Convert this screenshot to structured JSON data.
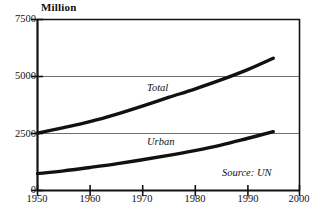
{
  "chart_data": {
    "type": "line",
    "title": "",
    "subtitle": "",
    "unit_label": "Million",
    "xlabel": "",
    "ylabel": "",
    "xlim": [
      1950,
      2000
    ],
    "ylim": [
      0,
      7500
    ],
    "xticks": [
      "1950",
      "1960",
      "1970",
      "1980",
      "1990",
      "2000"
    ],
    "xtick_values": [
      1950,
      1960,
      1970,
      1980,
      1990,
      2000
    ],
    "yticks": [
      "0",
      "2500",
      "5000",
      "7500"
    ],
    "ytick_values": [
      0,
      2500,
      5000,
      7500
    ],
    "grid": "horizontal",
    "gridlines_at": [
      2500,
      5000
    ],
    "legend_position": "inline-annotations",
    "annotations": [
      {
        "name": "total-label",
        "text": "Total",
        "x": 1972,
        "y": 4150
      },
      {
        "name": "urban-label",
        "text": "Urban",
        "x": 1972,
        "y": 1800
      },
      {
        "name": "source-note",
        "text": "Source: UN",
        "x": 1990,
        "y": 500
      }
    ],
    "x": [
      1950,
      1955,
      1960,
      1965,
      1970,
      1975,
      1980,
      1985,
      1990,
      1995
    ],
    "series": [
      {
        "name": "Total",
        "values": [
          2520,
          2760,
          3020,
          3340,
          3700,
          4080,
          4450,
          4850,
          5290,
          5800
        ]
      },
      {
        "name": "Urban",
        "values": [
          740,
          860,
          1010,
          1170,
          1350,
          1540,
          1750,
          1990,
          2280,
          2580
        ]
      }
    ]
  },
  "style": {
    "line_color": "#111111",
    "grid_color": "#6f6f6f",
    "axis_color": "#111111",
    "background": "#ffffff"
  }
}
